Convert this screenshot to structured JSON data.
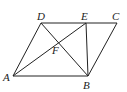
{
  "diagram": {
    "type": "geometry",
    "points": {
      "A": {
        "label": "A",
        "x": 13,
        "y": 76,
        "lx": 3,
        "ly": 81
      },
      "B": {
        "label": "B",
        "x": 88,
        "y": 76,
        "lx": 83,
        "ly": 89
      },
      "C": {
        "label": "C",
        "x": 117,
        "y": 23,
        "lx": 112,
        "ly": 20
      },
      "D": {
        "label": "D",
        "x": 41,
        "y": 23,
        "lx": 37,
        "ly": 20
      },
      "E": {
        "label": "E",
        "x": 86,
        "y": 23,
        "lx": 81,
        "ly": 20
      },
      "F": {
        "label": "F",
        "x": 58,
        "y": 43,
        "lx": 52,
        "ly": 54
      }
    },
    "segments": [
      "AB",
      "BC",
      "CD",
      "DA",
      "DB",
      "AE",
      "EB"
    ],
    "stroke": "#222222"
  }
}
